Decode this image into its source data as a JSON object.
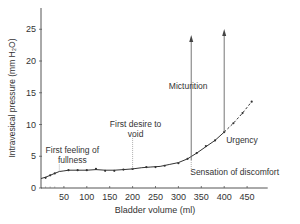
{
  "chart_data": {
    "type": "line",
    "title": "",
    "xlabel": "Bladder volume (ml)",
    "ylabel": "Intravesical pressure (mm H₂O)",
    "xlim": [
      0,
      500
    ],
    "ylim": [
      0,
      28
    ],
    "x_ticks": [
      50,
      100,
      150,
      200,
      250,
      300,
      350,
      400,
      450
    ],
    "y_ticks": [
      0,
      5,
      10,
      15,
      20,
      25
    ],
    "grid": false,
    "legend": null,
    "series": [
      {
        "name": "Cystometrogram",
        "style": "solid",
        "x": [
          0,
          10,
          20,
          30,
          40,
          50,
          60,
          80,
          100,
          120,
          140,
          160,
          180,
          200,
          220,
          240,
          260,
          280,
          300,
          320,
          340,
          360,
          380,
          400
        ],
        "y": [
          1.5,
          1.7,
          2.0,
          2.3,
          2.6,
          2.7,
          2.8,
          2.8,
          2.8,
          2.9,
          2.8,
          2.8,
          2.9,
          3.0,
          3.2,
          3.3,
          3.4,
          3.7,
          4.0,
          4.6,
          5.5,
          6.5,
          7.5,
          8.8
        ]
      },
      {
        "name": "Extrapolation",
        "style": "dashed",
        "x": [
          400,
          420,
          440,
          460
        ],
        "y": [
          8.8,
          10.2,
          11.8,
          13.6
        ]
      }
    ],
    "points": {
      "x": [
        10,
        20,
        30,
        60,
        80,
        100,
        120,
        140,
        160,
        180,
        200,
        230,
        250,
        270,
        300,
        320,
        340,
        360,
        380,
        400,
        420,
        440,
        460
      ],
      "y": [
        1.6,
        2.0,
        2.3,
        2.8,
        2.8,
        2.8,
        3.0,
        2.7,
        2.7,
        2.9,
        3.0,
        3.3,
        3.3,
        3.5,
        3.9,
        4.6,
        5.5,
        6.6,
        7.5,
        8.8,
        10.2,
        11.8,
        13.6
      ]
    },
    "annotations": [
      {
        "text": "First feeling of",
        "text2": "fullness",
        "x": 40,
        "y": 2.6
      },
      {
        "text": "First desire to",
        "text2": "void",
        "x": 200,
        "y": 3.0
      },
      {
        "text": "Micturition",
        "x": 328,
        "y": 4.4,
        "arrow_to_y": 24.5
      },
      {
        "text": "Urgency",
        "x": 400,
        "y": 8.8,
        "arrow_to_y": 25.3
      },
      {
        "text": "Sensation of discomfort",
        "x": 328,
        "y": 4.4
      }
    ]
  }
}
